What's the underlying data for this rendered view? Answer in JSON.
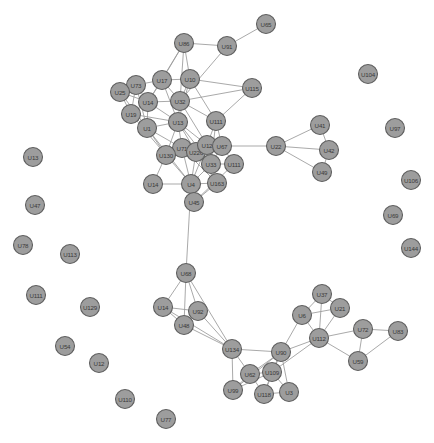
{
  "figure": {
    "type": "network-graph",
    "background_color": "#ffffff",
    "node_fill_color": "#9d9d9d",
    "node_stroke_color": "#5f5f5f",
    "edge_color": "#9a9a9a",
    "label_color": "#3a3a3a",
    "node_radius": 9.5,
    "width": 434,
    "height": 443
  },
  "chart_data": {
    "type": "scatter",
    "title": "",
    "xlabel": "",
    "ylabel": "",
    "grid": false,
    "legend": "none",
    "xlim": [
      0,
      434
    ],
    "ylim": [
      0,
      443
    ],
    "graph": {
      "directed": false,
      "node_count": 64,
      "edge_count": 120,
      "nodes": [
        {
          "id": "U65",
          "label": "U65",
          "x": 266,
          "y": 24,
          "degree": 1
        },
        {
          "id": "U86",
          "label": "U86",
          "x": 184,
          "y": 43,
          "degree": 4
        },
        {
          "id": "U91",
          "label": "U91",
          "x": 227,
          "y": 46,
          "degree": 3
        },
        {
          "id": "U104",
          "label": "U104",
          "x": 368,
          "y": 74,
          "degree": 0
        },
        {
          "id": "U17",
          "label": "U17",
          "x": 162,
          "y": 80,
          "degree": 6
        },
        {
          "id": "U10",
          "label": "U10",
          "x": 190,
          "y": 79,
          "degree": 6
        },
        {
          "id": "U73",
          "label": "U73",
          "x": 136,
          "y": 85,
          "degree": 6
        },
        {
          "id": "U25",
          "label": "U25",
          "x": 120,
          "y": 92,
          "degree": 5
        },
        {
          "id": "U115",
          "label": "U115",
          "x": 252,
          "y": 88,
          "degree": 3
        },
        {
          "id": "U14",
          "label": "U14",
          "x": 148,
          "y": 102,
          "degree": 8
        },
        {
          "id": "U32",
          "label": "U32",
          "x": 180,
          "y": 101,
          "degree": 8
        },
        {
          "id": "U19",
          "label": "U19",
          "x": 131,
          "y": 114,
          "degree": 7
        },
        {
          "id": "U97",
          "label": "U97",
          "x": 395,
          "y": 128,
          "degree": 0
        },
        {
          "id": "U1",
          "label": "U1",
          "x": 147,
          "y": 128,
          "degree": 8
        },
        {
          "id": "U13",
          "label": "U13",
          "x": 178,
          "y": 122,
          "degree": 10
        },
        {
          "id": "U111",
          "label": "U111",
          "x": 216,
          "y": 121,
          "degree": 6
        },
        {
          "id": "U41",
          "label": "U41",
          "x": 320,
          "y": 125,
          "degree": 2
        },
        {
          "id": "U71",
          "label": "U71",
          "x": 182,
          "y": 148,
          "degree": 10
        },
        {
          "id": "U226",
          "label": "U226",
          "x": 196,
          "y": 152,
          "degree": 10
        },
        {
          "id": "U12",
          "label": "U12",
          "x": 207,
          "y": 145,
          "degree": 9
        },
        {
          "id": "U67",
          "label": "U67",
          "x": 222,
          "y": 146,
          "degree": 8
        },
        {
          "id": "U22",
          "label": "U22",
          "x": 276,
          "y": 146,
          "degree": 4
        },
        {
          "id": "U42",
          "label": "U42",
          "x": 329,
          "y": 150,
          "degree": 3
        },
        {
          "id": "U130",
          "label": "U130",
          "x": 166,
          "y": 155,
          "degree": 7
        },
        {
          "id": "U33",
          "label": "U33",
          "x": 211,
          "y": 164,
          "degree": 7
        },
        {
          "id": "U112a",
          "label": "U111",
          "x": 234,
          "y": 164,
          "degree": 3
        },
        {
          "id": "U49",
          "label": "U49",
          "x": 322,
          "y": 172,
          "degree": 2
        },
        {
          "id": "U14b",
          "label": "U14",
          "x": 153,
          "y": 184,
          "degree": 3
        },
        {
          "id": "U4",
          "label": "U4",
          "x": 191,
          "y": 184,
          "degree": 9
        },
        {
          "id": "U163",
          "label": "U163",
          "x": 217,
          "y": 183,
          "degree": 4
        },
        {
          "id": "U106",
          "label": "U106",
          "x": 411,
          "y": 180,
          "degree": 0
        },
        {
          "id": "U45",
          "label": "U45",
          "x": 194,
          "y": 202,
          "degree": 3
        },
        {
          "id": "U13b",
          "label": "U13",
          "x": 33,
          "y": 157,
          "degree": 0
        },
        {
          "id": "U69",
          "label": "U69",
          "x": 393,
          "y": 215,
          "degree": 0
        },
        {
          "id": "U47",
          "label": "U47",
          "x": 35,
          "y": 205,
          "degree": 0
        },
        {
          "id": "U78",
          "label": "U78",
          "x": 23,
          "y": 245,
          "degree": 0
        },
        {
          "id": "U113",
          "label": "U113",
          "x": 70,
          "y": 254,
          "degree": 0
        },
        {
          "id": "U144",
          "label": "U144",
          "x": 411,
          "y": 248,
          "degree": 0
        },
        {
          "id": "U68",
          "label": "U68",
          "x": 186,
          "y": 273,
          "degree": 5
        },
        {
          "id": "U111b",
          "label": "U111",
          "x": 36,
          "y": 295,
          "degree": 0
        },
        {
          "id": "U14c",
          "label": "U14",
          "x": 163,
          "y": 307,
          "degree": 4
        },
        {
          "id": "U92",
          "label": "U92",
          "x": 198,
          "y": 311,
          "degree": 5
        },
        {
          "id": "U129",
          "label": "U129",
          "x": 90,
          "y": 307,
          "degree": 0
        },
        {
          "id": "U37",
          "label": "U37",
          "x": 322,
          "y": 294,
          "degree": 3
        },
        {
          "id": "U48",
          "label": "U48",
          "x": 184,
          "y": 325,
          "degree": 5
        },
        {
          "id": "U21",
          "label": "U21",
          "x": 340,
          "y": 308,
          "degree": 3
        },
        {
          "id": "U6",
          "label": "U6",
          "x": 302,
          "y": 315,
          "degree": 4
        },
        {
          "id": "U54",
          "label": "U54",
          "x": 65,
          "y": 346,
          "degree": 0
        },
        {
          "id": "U134",
          "label": "U134",
          "x": 232,
          "y": 349,
          "degree": 5
        },
        {
          "id": "U112",
          "label": "U112",
          "x": 319,
          "y": 338,
          "degree": 6
        },
        {
          "id": "U90",
          "label": "U90",
          "x": 281,
          "y": 352,
          "degree": 7
        },
        {
          "id": "U72",
          "label": "U72",
          "x": 363,
          "y": 329,
          "degree": 3
        },
        {
          "id": "U83",
          "label": "U83",
          "x": 398,
          "y": 331,
          "degree": 2
        },
        {
          "id": "U12b",
          "label": "U12",
          "x": 99,
          "y": 363,
          "degree": 0
        },
        {
          "id": "U62",
          "label": "U62",
          "x": 250,
          "y": 374,
          "degree": 5
        },
        {
          "id": "U109",
          "label": "U109",
          "x": 272,
          "y": 372,
          "degree": 6
        },
        {
          "id": "U59",
          "label": "U59",
          "x": 358,
          "y": 361,
          "degree": 3
        },
        {
          "id": "U99",
          "label": "U99",
          "x": 233,
          "y": 390,
          "degree": 4
        },
        {
          "id": "U118",
          "label": "U118",
          "x": 264,
          "y": 394,
          "degree": 4
        },
        {
          "id": "U3",
          "label": "U3",
          "x": 289,
          "y": 392,
          "degree": 4
        },
        {
          "id": "U110",
          "label": "U110",
          "x": 125,
          "y": 399,
          "degree": 0
        },
        {
          "id": "U77",
          "label": "U77",
          "x": 166,
          "y": 419,
          "degree": 0
        }
      ],
      "edges": [
        [
          "U65",
          "U91"
        ],
        [
          "U91",
          "U86"
        ],
        [
          "U91",
          "U32"
        ],
        [
          "U86",
          "U17"
        ],
        [
          "U86",
          "U10"
        ],
        [
          "U86",
          "U32"
        ],
        [
          "U86",
          "U14"
        ],
        [
          "U115",
          "U10"
        ],
        [
          "U115",
          "U32"
        ],
        [
          "U115",
          "U111"
        ],
        [
          "U17",
          "U10"
        ],
        [
          "U17",
          "U73"
        ],
        [
          "U17",
          "U14"
        ],
        [
          "U17",
          "U32"
        ],
        [
          "U17",
          "U13"
        ],
        [
          "U10",
          "U32"
        ],
        [
          "U10",
          "U13"
        ],
        [
          "U10",
          "U111"
        ],
        [
          "U73",
          "U25"
        ],
        [
          "U73",
          "U14"
        ],
        [
          "U73",
          "U19"
        ],
        [
          "U73",
          "U1"
        ],
        [
          "U25",
          "U19"
        ],
        [
          "U25",
          "U14"
        ],
        [
          "U25",
          "U1"
        ],
        [
          "U14",
          "U32"
        ],
        [
          "U14",
          "U19"
        ],
        [
          "U14",
          "U1"
        ],
        [
          "U14",
          "U13"
        ],
        [
          "U19",
          "U1"
        ],
        [
          "U19",
          "U13"
        ],
        [
          "U19",
          "U130"
        ],
        [
          "U32",
          "U13"
        ],
        [
          "U32",
          "U111"
        ],
        [
          "U32",
          "U12"
        ],
        [
          "U1",
          "U13"
        ],
        [
          "U1",
          "U130"
        ],
        [
          "U1",
          "U71"
        ],
        [
          "U1",
          "U4"
        ],
        [
          "U13",
          "U71"
        ],
        [
          "U13",
          "U226"
        ],
        [
          "U13",
          "U12"
        ],
        [
          "U13",
          "U33"
        ],
        [
          "U13",
          "U130"
        ],
        [
          "U111",
          "U12"
        ],
        [
          "U111",
          "U67"
        ],
        [
          "U111",
          "U33"
        ],
        [
          "U71",
          "U226"
        ],
        [
          "U71",
          "U12"
        ],
        [
          "U71",
          "U67"
        ],
        [
          "U71",
          "U130"
        ],
        [
          "U71",
          "U33"
        ],
        [
          "U71",
          "U4"
        ],
        [
          "U71",
          "U163"
        ],
        [
          "U226",
          "U12"
        ],
        [
          "U226",
          "U67"
        ],
        [
          "U226",
          "U33"
        ],
        [
          "U226",
          "U4"
        ],
        [
          "U226",
          "U130"
        ],
        [
          "U226",
          "U163"
        ],
        [
          "U12",
          "U67"
        ],
        [
          "U12",
          "U33"
        ],
        [
          "U12",
          "U4"
        ],
        [
          "U67",
          "U22"
        ],
        [
          "U67",
          "U33"
        ],
        [
          "U67",
          "U112a"
        ],
        [
          "U22",
          "U41"
        ],
        [
          "U22",
          "U42"
        ],
        [
          "U22",
          "U49"
        ],
        [
          "U41",
          "U42"
        ],
        [
          "U42",
          "U49"
        ],
        [
          "U130",
          "U14b"
        ],
        [
          "U130",
          "U4"
        ],
        [
          "U33",
          "U163"
        ],
        [
          "U33",
          "U4"
        ],
        [
          "U112a",
          "U33"
        ],
        [
          "U112a",
          "U45"
        ],
        [
          "U14b",
          "U4"
        ],
        [
          "U4",
          "U163"
        ],
        [
          "U4",
          "U45"
        ],
        [
          "U4",
          "U68"
        ],
        [
          "U163",
          "U45"
        ],
        [
          "U68",
          "U14c"
        ],
        [
          "U68",
          "U92"
        ],
        [
          "U68",
          "U48"
        ],
        [
          "U68",
          "U134"
        ],
        [
          "U14c",
          "U92"
        ],
        [
          "U14c",
          "U48"
        ],
        [
          "U14c",
          "U134"
        ],
        [
          "U92",
          "U48"
        ],
        [
          "U92",
          "U134"
        ],
        [
          "U48",
          "U134"
        ],
        [
          "U134",
          "U90"
        ],
        [
          "U134",
          "U62"
        ],
        [
          "U134",
          "U99"
        ],
        [
          "U37",
          "U21"
        ],
        [
          "U37",
          "U6"
        ],
        [
          "U37",
          "U112"
        ],
        [
          "U21",
          "U6"
        ],
        [
          "U21",
          "U112"
        ],
        [
          "U6",
          "U112"
        ],
        [
          "U6",
          "U90"
        ],
        [
          "U112",
          "U90"
        ],
        [
          "U112",
          "U72"
        ],
        [
          "U112",
          "U59"
        ],
        [
          "U112",
          "U109"
        ],
        [
          "U72",
          "U83"
        ],
        [
          "U72",
          "U59"
        ],
        [
          "U83",
          "U59"
        ],
        [
          "U90",
          "U62"
        ],
        [
          "U90",
          "U109"
        ],
        [
          "U90",
          "U118"
        ],
        [
          "U90",
          "U3"
        ],
        [
          "U90",
          "U99"
        ],
        [
          "U62",
          "U109"
        ],
        [
          "U62",
          "U99"
        ],
        [
          "U62",
          "U118"
        ],
        [
          "U109",
          "U118"
        ],
        [
          "U109",
          "U3"
        ],
        [
          "U109",
          "U99"
        ],
        [
          "U118",
          "U3"
        ]
      ]
    }
  }
}
